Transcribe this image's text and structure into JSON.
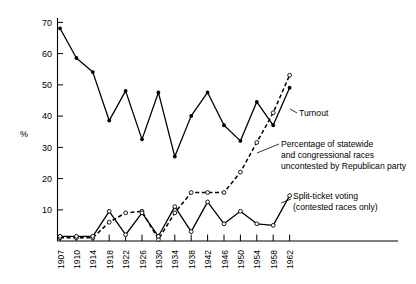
{
  "chart_data": {
    "type": "line",
    "title": "",
    "subtitle": "",
    "xlabel": "",
    "ylabel": "%",
    "ylim": [
      0,
      73
    ],
    "xlim": [
      1907,
      1962
    ],
    "grid": false,
    "legend_position": "inline-annotations",
    "y_ticks": [
      10,
      20,
      30,
      40,
      50,
      60,
      70
    ],
    "x_ticks": [
      1907,
      1910,
      1914,
      1918,
      1922,
      1926,
      1930,
      1934,
      1938,
      1942,
      1946,
      1950,
      1954,
      1958,
      1962
    ],
    "x_tick_labels": [
      "1907",
      "1910",
      "1914",
      "1918",
      "1922",
      "1926",
      "1930",
      "1934",
      "1938",
      "1942",
      "1946",
      "1950",
      "1954",
      "1958",
      "1962"
    ],
    "series": [
      {
        "name": "Turnout",
        "style": "solid",
        "marker": "filled-circle",
        "x": [
          1907,
          1910,
          1914,
          1918,
          1922,
          1926,
          1930,
          1934,
          1938,
          1942,
          1946,
          1950,
          1954,
          1958,
          1962
        ],
        "values": [
          68,
          58.5,
          54,
          38.5,
          48,
          32.5,
          47.5,
          27,
          40,
          47.5,
          37,
          32,
          44.5,
          37,
          49
        ]
      },
      {
        "name": "Percentage of statewide and congressional races uncontested by Republican party",
        "style": "dashed",
        "marker": "open-circle",
        "x": [
          1907,
          1910,
          1914,
          1918,
          1922,
          1926,
          1930,
          1934,
          1938,
          1942,
          1946,
          1950,
          1954,
          1958,
          1962
        ],
        "values": [
          1,
          1,
          1,
          6,
          9,
          9.5,
          0.5,
          9,
          15.5,
          15.5,
          15.5,
          22,
          31.5,
          41,
          53
        ]
      },
      {
        "name": "Split-ticket voting (contested races only)",
        "style": "solid",
        "marker": "open-circle",
        "x": [
          1907,
          1910,
          1914,
          1918,
          1922,
          1926,
          1930,
          1934,
          1938,
          1942,
          1946,
          1950,
          1954,
          1958,
          1962
        ],
        "values": [
          1.5,
          1.5,
          1.5,
          9.5,
          2,
          9,
          1.5,
          11,
          3,
          12.5,
          5.5,
          9.5,
          5.5,
          5,
          14.5
        ]
      }
    ],
    "annotations": [
      {
        "id": "turnout",
        "lines": [
          "Turnout"
        ]
      },
      {
        "id": "uncontested",
        "lines": [
          "Percentage of statewide",
          "and congressional races",
          "uncontested by Republican party"
        ]
      },
      {
        "id": "split-ticket",
        "lines": [
          "Split-ticket voting",
          "(contested races only)"
        ]
      }
    ],
    "colors": {
      "ink": "#000000",
      "background": "#ffffff"
    }
  }
}
